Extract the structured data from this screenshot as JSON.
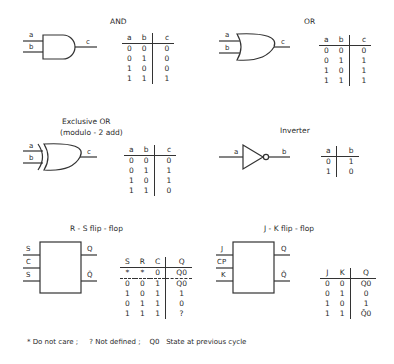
{
  "gates": {
    "and": {
      "title": "AND",
      "inputs": [
        "a",
        "b"
      ],
      "output": "c",
      "headers": [
        "a",
        "b",
        "c"
      ],
      "rows": [
        [
          "0",
          "0",
          "0"
        ],
        [
          "0",
          "1",
          "0"
        ],
        [
          "1",
          "0",
          "0"
        ],
        [
          "1",
          "1",
          "1"
        ]
      ]
    },
    "or": {
      "title": "OR",
      "inputs": [
        "a",
        "b"
      ],
      "output": "c",
      "headers": [
        "a",
        "b",
        "c"
      ],
      "rows": [
        [
          "0",
          "0",
          "0"
        ],
        [
          "0",
          "1",
          "1"
        ],
        [
          "1",
          "0",
          "1"
        ],
        [
          "1",
          "1",
          "1"
        ]
      ]
    },
    "xor": {
      "title": "Exclusive OR",
      "subtitle": "(modulo - 2 add)",
      "inputs": [
        "a",
        "b"
      ],
      "output": "c",
      "headers": [
        "a",
        "b",
        "c"
      ],
      "rows": [
        [
          "0",
          "0",
          "0"
        ],
        [
          "0",
          "1",
          "1"
        ],
        [
          "1",
          "0",
          "1"
        ],
        [
          "1",
          "1",
          "0"
        ]
      ]
    },
    "inverter": {
      "title": "Inverter",
      "input": "a",
      "output": "b",
      "headers": [
        "a",
        "b"
      ],
      "rows": [
        [
          "0",
          "1"
        ],
        [
          "1",
          "0"
        ]
      ]
    }
  },
  "flipflops": {
    "rs": {
      "title": "R - S flip - flop",
      "inputs": [
        "S",
        "C",
        "S"
      ],
      "outputs": [
        "Q",
        "Q̄"
      ],
      "headers": [
        "S",
        "R",
        "C",
        "Q"
      ],
      "rows": [
        [
          "*",
          "*",
          "0",
          "Q0"
        ],
        [
          "0",
          "0",
          "1",
          "Q0"
        ],
        [
          "1",
          "0",
          "1",
          "1"
        ],
        [
          "0",
          "1",
          "1",
          "0"
        ],
        [
          "1",
          "1",
          "1",
          "?"
        ]
      ]
    },
    "jk": {
      "title": "J - K flip - flop",
      "inputs": [
        "J",
        "CP",
        "K"
      ],
      "outputs": [
        "Q",
        "Q̄"
      ],
      "headers": [
        "J",
        "K",
        "Q"
      ],
      "rows": [
        [
          "0",
          "0",
          "Q0"
        ],
        [
          "0",
          "1",
          "0"
        ],
        [
          "1",
          "0",
          "1"
        ],
        [
          "1",
          "1",
          "Q̄0"
        ]
      ]
    }
  },
  "footer": {
    "dont_care": "* Do not care ;",
    "not_defined": "? Not defined ;",
    "q0_symbol": "Q0",
    "q0_desc": "State at previous cycle"
  }
}
